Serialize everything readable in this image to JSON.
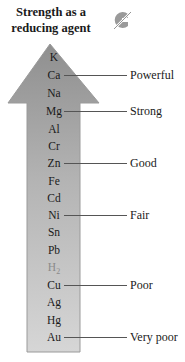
{
  "title": {
    "line1": "Strength as a",
    "line2": "reducing agent"
  },
  "logo_icon": "publisher-logo-icon",
  "colors": {
    "arrow_top": "#8f8f8f",
    "arrow_bottom": "#d4d4d4",
    "arrow_border": "#9a9a9a",
    "text": "#1a1a1a",
    "h2_text": "#8a8a8a",
    "leader_line": "#555555"
  },
  "elements": [
    {
      "symbol": "K",
      "y": 57
    },
    {
      "symbol": "Ca",
      "y": 75
    },
    {
      "symbol": "Na",
      "y": 93
    },
    {
      "symbol": "Mg",
      "y": 111
    },
    {
      "symbol": "Al",
      "y": 129
    },
    {
      "symbol": "Cr",
      "y": 146
    },
    {
      "symbol": "Zn",
      "y": 163
    },
    {
      "symbol": "Fe",
      "y": 181
    },
    {
      "symbol": "Cd",
      "y": 198
    },
    {
      "symbol": "Ni",
      "y": 215
    },
    {
      "symbol": "Sn",
      "y": 232
    },
    {
      "symbol": "Pb",
      "y": 250
    },
    {
      "symbol": "H",
      "subscript": "2",
      "y": 267
    },
    {
      "symbol": "Cu",
      "y": 285
    },
    {
      "symbol": "Ag",
      "y": 302
    },
    {
      "symbol": "Hg",
      "y": 320
    },
    {
      "symbol": "Au",
      "y": 337
    }
  ],
  "levels": [
    {
      "label": "Powerful",
      "element": "Ca",
      "y": 75
    },
    {
      "label": "Strong",
      "element": "Mg",
      "y": 111
    },
    {
      "label": "Good",
      "element": "Zn",
      "y": 163
    },
    {
      "label": "Fair",
      "element": "Ni",
      "y": 215
    },
    {
      "label": "Poor",
      "element": "Cu",
      "y": 285
    },
    {
      "label": "Very poor",
      "element": "Au",
      "y": 337
    }
  ]
}
